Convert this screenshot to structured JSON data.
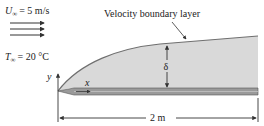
{
  "diagram": {
    "type": "flat-plate-velocity-boundary-layer",
    "freestream": {
      "velocity_symbol": "U",
      "velocity_subscript": "∞",
      "velocity_value": "= 5 m/s",
      "temperature_symbol": "T",
      "temperature_subscript": "∞",
      "temperature_value": "= 20 °C",
      "flow_arrow_count": 3
    },
    "boundary_layer_label": "Velocity boundary layer",
    "thickness_symbol": "δ",
    "axes": {
      "x_label": "x",
      "y_label": "y"
    },
    "plate_length_label": "2 m",
    "colors": {
      "boundary_layer_fill": "#d9d9d9",
      "boundary_layer_edge": "#6f6f6f",
      "plate_fill": "#9a9a9a",
      "line": "#333333"
    }
  }
}
